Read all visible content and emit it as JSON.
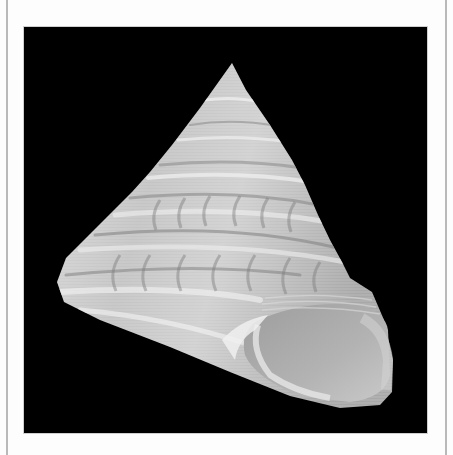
{
  "image": {
    "subject": "top shell (trochid sea snail) specimen",
    "description": "Conical spiral gastropod shell photographed on a black background, aperture facing lower right",
    "colors": {
      "page_background": "#fdfdfd",
      "frame_border": "#b9b9b9",
      "photo_background": "#000000",
      "shell_light": "#e8e8e8",
      "shell_mid": "#b8b8b8",
      "shell_dark": "#8a8a8a",
      "aperture": "#a9a9a9"
    }
  }
}
